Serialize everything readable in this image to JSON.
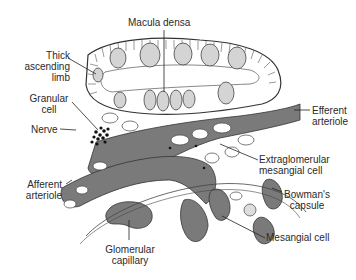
{
  "diagram": {
    "labels": {
      "macula_densa": "Macula densa",
      "thick_ascending_limb": [
        "Thick",
        "ascending",
        "limb"
      ],
      "granular_cell": [
        "Granular",
        "cell"
      ],
      "nerve": "Nerve",
      "efferent_arteriole": [
        "Efferent",
        "arteriole"
      ],
      "extraglomerular_mesangial_cell": [
        "Extraglomerular",
        "mesangial cell"
      ],
      "afferent_arteriole": [
        "Afferent",
        "arteriole"
      ],
      "bowmans_capsule": [
        "Bowman's",
        "capsule"
      ],
      "mesangial_cell": "Mesangial cell",
      "glomerular_capillary": [
        "Glomerular",
        "capillary"
      ]
    },
    "colors": {
      "vessel_fill": "#7a7a7a",
      "nucleus_fill": "#d4d4d4",
      "line": "#333333",
      "background": "#ffffff"
    }
  }
}
